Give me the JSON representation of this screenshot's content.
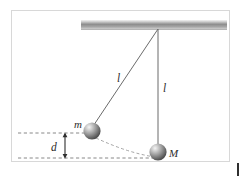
{
  "figure": {
    "frame": {
      "border_color": "#d8d8d8",
      "background": "#ffffff"
    },
    "ceiling": {
      "name": "support-beam",
      "x": 81,
      "y": 20,
      "width": 146,
      "height": 9,
      "color_top": "#e9e9e9",
      "color_mid": "#8d8d8d",
      "color_bottom": "#bfbfbf"
    },
    "pivot": {
      "x": 158,
      "y": 29
    },
    "strings": [
      {
        "name": "string-to-m",
        "x1": 158,
        "y1": 29,
        "x2": 92,
        "y2": 127,
        "color": "#6b6b6b"
      },
      {
        "name": "string-to-M",
        "x1": 158,
        "y1": 29,
        "x2": 158,
        "y2": 148,
        "color": "#6b6b6b"
      }
    ],
    "balls": [
      {
        "name": "ball-m",
        "label": "m",
        "cx": 92,
        "cy": 131,
        "r": 8.5,
        "label_x": 74,
        "label_y": 127
      },
      {
        "name": "ball-M",
        "label": "M",
        "cx": 158,
        "cy": 152,
        "r": 8.5,
        "label_x": 170,
        "label_y": 156
      }
    ],
    "length_labels": [
      {
        "name": "length-label-left",
        "text": "l",
        "x": 118,
        "y": 81
      },
      {
        "name": "length-label-right",
        "text": "l",
        "x": 164,
        "y": 91
      }
    ],
    "drop_label": {
      "name": "drop-label",
      "text": "d",
      "x": 53,
      "y": 150
    },
    "dashed_lines": [
      {
        "name": "dashed-line-upper",
        "x1": 18,
        "y1": 133,
        "x2": 92,
        "y2": 133,
        "color": "#7a7a7a"
      },
      {
        "name": "dashed-line-lower",
        "x1": 18,
        "y1": 158,
        "x2": 158,
        "y2": 158,
        "color": "#7a7a7a"
      }
    ],
    "dashed_arc": {
      "name": "swing-arc",
      "start_x": 96,
      "start_y": 138,
      "ctrl_x": 128,
      "ctrl_y": 152,
      "end_x": 155,
      "end_y": 157,
      "color": "#9a9a9a"
    },
    "dimension_arrow": {
      "name": "drop-dimension-arrow",
      "x": 65,
      "y_top": 133,
      "y_bottom": 158,
      "color": "#2f2f2f"
    },
    "corner_tick": {
      "name": "corner-tick-mark",
      "color": "#2f2f2f"
    }
  }
}
